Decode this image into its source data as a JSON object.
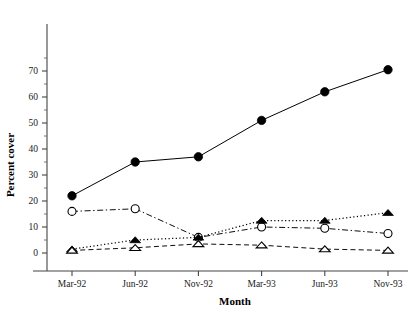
{
  "chart_data": {
    "type": "line",
    "title": "",
    "subtitle": "",
    "xlabel": "Month",
    "ylabel": "Percent cover",
    "categories": [
      "Mar-92",
      "Jun-92",
      "Nov-92",
      "Mar-93",
      "Jun-93",
      "Nov-93"
    ],
    "ylim": [
      0,
      75
    ],
    "xlim": [
      0,
      5
    ],
    "y_ticks": [
      0,
      10,
      20,
      30,
      40,
      50,
      60,
      70
    ],
    "y_tick_labels": [
      "0",
      "10",
      "20",
      "30",
      "40",
      "50",
      "60",
      "70"
    ],
    "y_minor_ticks": [
      5,
      15,
      25,
      35,
      45,
      55,
      65,
      75
    ],
    "grid": false,
    "legend": "none",
    "series": [
      {
        "name": "series-1",
        "marker": "filled-circle",
        "linestyle": "solid",
        "values": [
          22,
          35,
          37,
          51,
          62,
          70.5
        ]
      },
      {
        "name": "series-2",
        "marker": "open-circle",
        "linestyle": "dash-dot",
        "values": [
          16,
          17,
          6,
          10,
          9.5,
          7.5
        ]
      },
      {
        "name": "series-3",
        "marker": "filled-triangle",
        "linestyle": "dotted",
        "values": [
          1.5,
          5,
          6,
          12.5,
          12.5,
          15.5
        ]
      },
      {
        "name": "series-4",
        "marker": "open-triangle",
        "linestyle": "dashed",
        "values": [
          1,
          2,
          3.5,
          3,
          1.5,
          1
        ]
      }
    ]
  },
  "colors": {
    "foreground": "#000000",
    "axis": "#444444",
    "background": "#ffffff"
  }
}
